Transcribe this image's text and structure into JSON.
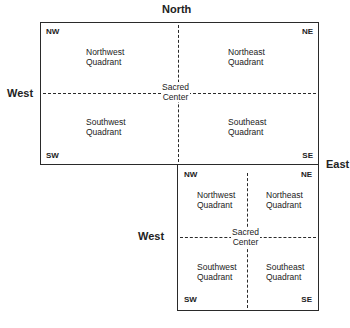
{
  "diagram": {
    "large": {
      "directions": {
        "north": "North",
        "west": "West",
        "east": "East"
      },
      "corners": {
        "nw": "NW",
        "ne": "NE",
        "sw": "SW",
        "se": "SE"
      },
      "quadrants": {
        "nw": [
          "Northwest",
          "Quadrant"
        ],
        "ne": [
          "Northeast",
          "Quadrant"
        ],
        "sw": [
          "Southwest",
          "Quadrant"
        ],
        "se": [
          "Southeast",
          "Quadrant"
        ]
      },
      "center": [
        "Sacred",
        "Center"
      ]
    },
    "small": {
      "directions": {
        "west": "West"
      },
      "corners": {
        "nw": "NW",
        "ne": "NE",
        "sw": "SW",
        "se": "SE"
      },
      "quadrants": {
        "nw": [
          "Northwest",
          "Quadrant"
        ],
        "ne": [
          "Northeast",
          "Quadrant"
        ],
        "sw": [
          "Southwest",
          "Quadrant"
        ],
        "se": [
          "Southeast",
          "Quadrant"
        ]
      },
      "center": [
        "Sacred",
        "Center"
      ]
    }
  }
}
